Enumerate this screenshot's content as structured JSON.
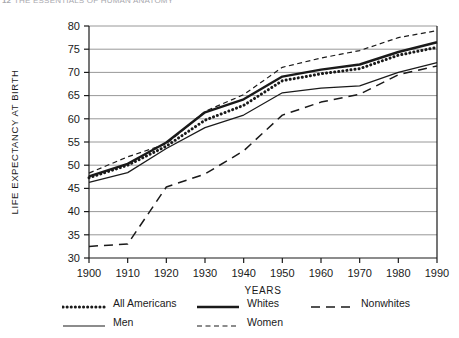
{
  "header": {
    "folio": "12",
    "running_title": "THE ESSENTIALS OF HUMAN ANATOMY"
  },
  "chart_data": {
    "type": "line",
    "title": "",
    "xlabel": "YEARS",
    "ylabel": "LIFE EXPECTANCY AT BIRTH",
    "xlim": [
      1900,
      1990
    ],
    "ylim": [
      30,
      80
    ],
    "grid": "horizontal",
    "legend_position": "below",
    "xticks": [
      1900,
      1910,
      1920,
      1930,
      1940,
      1950,
      1960,
      1970,
      1980,
      1990
    ],
    "yticks": [
      30,
      35,
      40,
      45,
      50,
      55,
      60,
      65,
      70,
      75,
      80
    ],
    "x": [
      1900,
      1910,
      1920,
      1930,
      1940,
      1950,
      1960,
      1970,
      1980,
      1990
    ],
    "series": [
      {
        "name": "All Americans",
        "style": "thick-dotted",
        "values": [
          47.3,
          50.0,
          54.1,
          59.7,
          62.9,
          68.2,
          69.7,
          70.8,
          73.7,
          75.4
        ]
      },
      {
        "name": "Whites",
        "style": "thick-solid",
        "values": [
          47.6,
          50.3,
          54.9,
          61.4,
          64.2,
          69.1,
          70.6,
          71.7,
          74.4,
          76.5
        ]
      },
      {
        "name": "Nonwhites",
        "style": "long-dash",
        "values": [
          32.5,
          33.0,
          45.3,
          48.1,
          53.1,
          60.8,
          63.6,
          65.3,
          69.5,
          71.4
        ]
      },
      {
        "name": "Men",
        "style": "thin-solid",
        "values": [
          46.3,
          48.4,
          53.6,
          58.1,
          60.8,
          65.6,
          66.6,
          67.1,
          70.0,
          72.1
        ]
      },
      {
        "name": "Women",
        "style": "fine-dash",
        "values": [
          48.3,
          51.8,
          54.6,
          61.6,
          65.2,
          71.1,
          73.1,
          74.7,
          77.5,
          79.0
        ]
      }
    ]
  },
  "legend": {
    "rows": [
      [
        {
          "label": "All Americans",
          "style": "thick-dotted"
        },
        {
          "label": "Whites",
          "style": "thick-solid"
        },
        {
          "label": "Nonwhites",
          "style": "long-dash"
        }
      ],
      [
        {
          "label": "Men",
          "style": "thin-solid"
        },
        {
          "label": "Women",
          "style": "fine-dash"
        }
      ]
    ]
  },
  "colors": {
    "ink": "#1a1a1a",
    "grid": "#8c8c8c",
    "axis": "#1a1a1a",
    "header": "#a8a8ae",
    "background": "#ffffff"
  }
}
